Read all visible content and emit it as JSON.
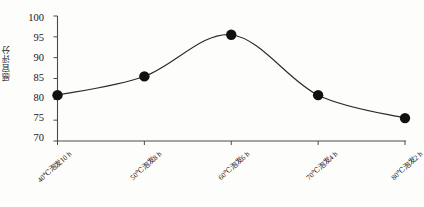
{
  "chart_data": {
    "type": "line",
    "title": "",
    "subtitle": "",
    "xlabel": "",
    "ylabel": "感官评分",
    "categories": [
      "40℃泡发10 h",
      "50℃泡发8 h",
      "60℃泡发6 h",
      "70℃泡发4 h",
      "80℃泡发2 h"
    ],
    "series": [
      {
        "name": "感官评分",
        "values": [
          81,
          85.5,
          95.5,
          81,
          75.5
        ]
      }
    ],
    "ylim": [
      70,
      100
    ],
    "yticks": [
      70,
      75,
      80,
      85,
      90,
      95,
      100
    ],
    "ytick_labels": [
      "70",
      "75",
      "80",
      "85",
      "90",
      "95",
      "100"
    ],
    "grid": false,
    "legend": false,
    "legend_position": "none",
    "marker": "filled-circle",
    "marker_color": "#111111",
    "line_color": "#2a2a2a",
    "smoothing": "spline",
    "axis_color": "#444444",
    "background": "#fdfdfb",
    "annotations": []
  }
}
